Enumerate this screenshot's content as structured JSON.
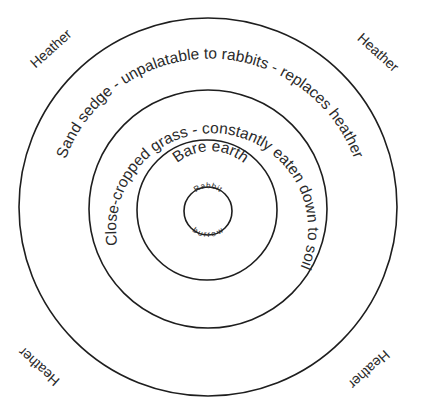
{
  "diagram": {
    "type": "concentric-zones",
    "zones": [
      {
        "id": "burrow",
        "label_top": "Rabbit",
        "label_bottom": "burrow"
      },
      {
        "id": "bare-earth",
        "label": "Bare earth"
      },
      {
        "id": "close-cropped-grass",
        "label": "Close-cropped grass  -  constantly eaten down to soil"
      },
      {
        "id": "sand-sedge",
        "label": "Sand sedge  -  unpalatable to rabbits  -  replaces heather"
      }
    ],
    "corners": {
      "top_left": "Heather",
      "top_right": "Heather",
      "bottom_left": "Heather",
      "bottom_right": "Heather"
    },
    "stroke_color": "#1e1e1e",
    "text_color": "#2a2a2a"
  }
}
